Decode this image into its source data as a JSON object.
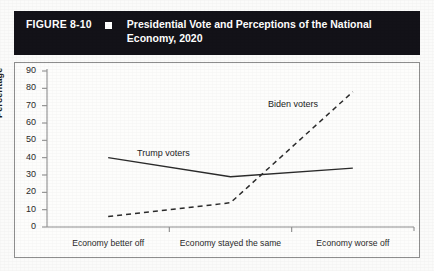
{
  "header": {
    "figure_number": "FIGURE 8-10",
    "bullet_icon": "white-square-bullet",
    "title": "Presidential Vote and Perceptions of the National Economy, 2020"
  },
  "chart_data": {
    "type": "line",
    "title": "Presidential Vote and Perceptions of the National Economy, 2020",
    "xlabel": "",
    "ylabel": "Percentage",
    "ylim": [
      0,
      90
    ],
    "ytick_step": 10,
    "yticks": [
      0,
      10,
      20,
      30,
      40,
      50,
      60,
      70,
      80,
      90
    ],
    "ytick_labels": [
      "0",
      "10",
      "20",
      "30",
      "40",
      "50",
      "60",
      "70",
      "80",
      "90"
    ],
    "categories": [
      "Economy better off",
      "Economy stayed the same",
      "Economy worse off"
    ],
    "grid": false,
    "legend": "inline-annotations",
    "series": [
      {
        "name": "Trump voters",
        "style": "solid",
        "color": "#2b2b2b",
        "values": [
          40,
          29,
          34
        ]
      },
      {
        "name": "Biden voters",
        "style": "dashed",
        "color": "#2b2b2b",
        "values": [
          6,
          14,
          78
        ]
      }
    ],
    "annotations": [
      {
        "text": "Trump voters",
        "series": "Trump voters"
      },
      {
        "text": "Biden voters",
        "series": "Biden voters"
      }
    ]
  },
  "colors": {
    "header_background": "#131218",
    "header_text": "#ffffff",
    "axis": "#8e8e8e",
    "line": "#2b2b2b",
    "page_background": "#fbfbfa"
  }
}
